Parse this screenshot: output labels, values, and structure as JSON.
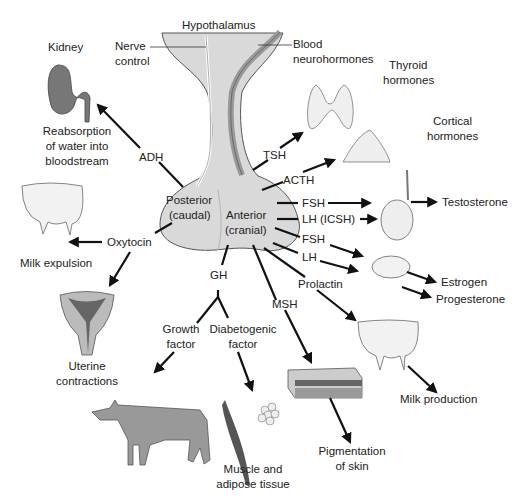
{
  "diagram": {
    "colors": {
      "gland": "#d9d9d9",
      "gland_stroke": "#555555",
      "arrow": "#111111",
      "text": "#222222",
      "organ_light": "#eeeeee",
      "organ_dark": "#777777"
    },
    "labels": {
      "hypothalamus": "Hypothalamus",
      "nerve_control_1": "Nerve",
      "nerve_control_2": "control",
      "blood_1": "Blood",
      "blood_2": "neurohormones",
      "posterior_1": "Posterior",
      "posterior_2": "(caudal)",
      "anterior_1": "Anterior",
      "anterior_2": "(cranial)"
    },
    "hormones": {
      "adh": "ADH",
      "oxytocin": "Oxytocin",
      "tsh": "TSH",
      "acth": "ACTH",
      "fsh_male": "FSH",
      "lh_icsh": "LH (ICSH)",
      "fsh_female": "FSH",
      "lh_female": "LH",
      "prolactin": "Prolactin",
      "msh": "MSH",
      "gh": "GH",
      "growth_factor_1": "Growth",
      "growth_factor_2": "factor",
      "diabetogenic_1": "Diabetogenic",
      "diabetogenic_2": "factor"
    },
    "targets": {
      "kidney": "Kidney",
      "reabsorption_1": "Reabsorption",
      "reabsorption_2": "of water into",
      "reabsorption_3": "bloodstream",
      "milk_expulsion": "Milk expulsion",
      "uterine_1": "Uterine",
      "uterine_2": "contractions",
      "thyroid_1": "Thyroid",
      "thyroid_2": "hormones",
      "cortical_1": "Cortical",
      "cortical_2": "hormones",
      "testosterone": "Testosterone",
      "estrogen": "Estrogen",
      "progesterone": "Progesterone",
      "milk_production": "Milk production",
      "pigmentation_1": "Pigmentation",
      "pigmentation_2": "of skin",
      "muscle_1": "Muscle and",
      "muscle_2": "adipose tissue"
    }
  }
}
